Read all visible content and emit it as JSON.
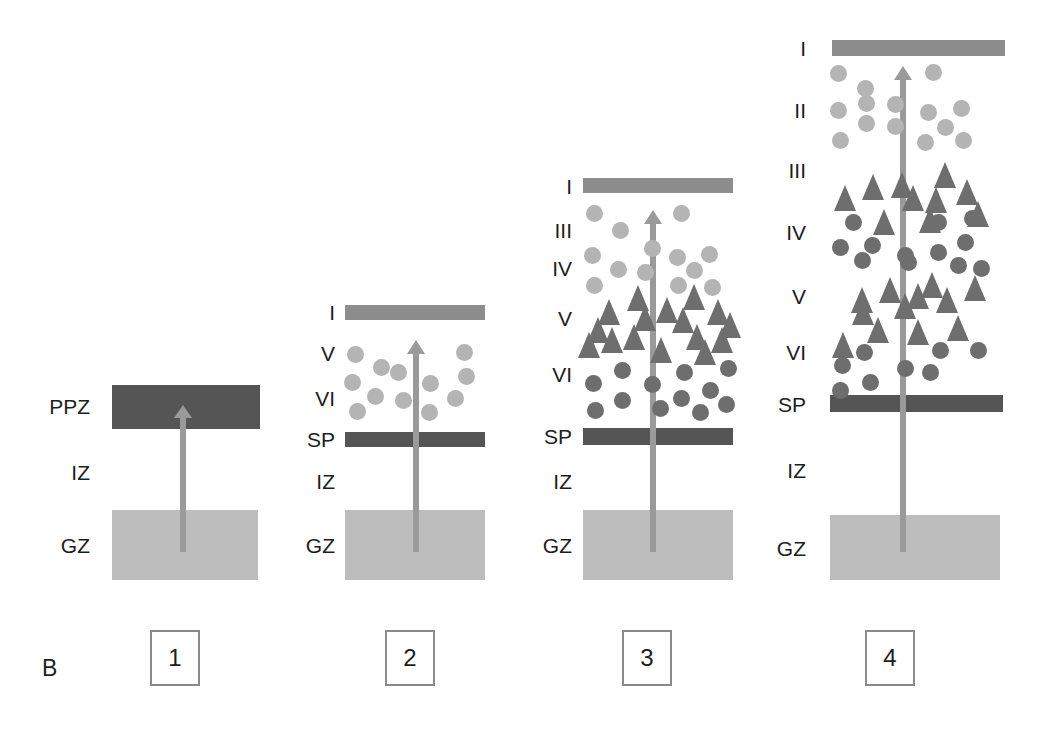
{
  "figure": {
    "panel_letter": "B",
    "colors": {
      "germinal_zone": "#bdbdbd",
      "layer_one_band": "#8d8d8d",
      "subplate_band": "#555555",
      "preplate_band": "#555555",
      "arrow": "#9a9a9a",
      "light_circle": "#b4b4b4",
      "dark_circle": "#6e6e6e",
      "triangle": "#6e6e6e",
      "box_border": "#8a8a8a",
      "text": "#1d1d1d",
      "background": "#ffffff"
    }
  },
  "panels": [
    {
      "number": "1",
      "labels": [
        "PPZ",
        "IZ",
        "GZ"
      ],
      "bands": [
        {
          "name": "preplate-zone",
          "label": "PPZ"
        },
        {
          "name": "intermediate-zone",
          "label": "IZ"
        },
        {
          "name": "germinal-zone",
          "label": "GZ"
        }
      ],
      "cells": {
        "light_circles": 0,
        "dark_circles": 0,
        "triangles": 0
      },
      "migration_arrow": true
    },
    {
      "number": "2",
      "labels": [
        "I",
        "V",
        "VI",
        "SP",
        "IZ",
        "GZ"
      ],
      "bands": [
        {
          "name": "layer-one",
          "label": "I"
        },
        {
          "name": "layer-five",
          "label": "V"
        },
        {
          "name": "layer-six",
          "label": "VI"
        },
        {
          "name": "subplate",
          "label": "SP"
        },
        {
          "name": "intermediate-zone",
          "label": "IZ"
        },
        {
          "name": "germinal-zone",
          "label": "GZ"
        }
      ],
      "cells": {
        "light_circles": 12,
        "dark_circles": 0,
        "triangles": 0
      },
      "migration_arrow": true
    },
    {
      "number": "3",
      "labels": [
        "I",
        "III",
        "IV",
        "V",
        "VI",
        "SP",
        "IZ",
        "GZ"
      ],
      "bands": [
        {
          "name": "layer-one",
          "label": "I"
        },
        {
          "name": "layer-three",
          "label": "III"
        },
        {
          "name": "layer-four",
          "label": "IV"
        },
        {
          "name": "layer-five",
          "label": "V"
        },
        {
          "name": "layer-six",
          "label": "VI"
        },
        {
          "name": "subplate",
          "label": "SP"
        },
        {
          "name": "intermediate-zone",
          "label": "IZ"
        },
        {
          "name": "germinal-zone",
          "label": "GZ"
        }
      ],
      "cells": {
        "light_circles": 13,
        "dark_circles": 12,
        "triangles": 16
      },
      "migration_arrow": true
    },
    {
      "number": "4",
      "labels": [
        "I",
        "II",
        "III",
        "IV",
        "V",
        "VI",
        "SP",
        "IZ",
        "GZ"
      ],
      "bands": [
        {
          "name": "layer-one",
          "label": "I"
        },
        {
          "name": "layer-two",
          "label": "II"
        },
        {
          "name": "layer-three",
          "label": "III"
        },
        {
          "name": "layer-four",
          "label": "IV"
        },
        {
          "name": "layer-five",
          "label": "V"
        },
        {
          "name": "layer-six",
          "label": "VI"
        },
        {
          "name": "subplate",
          "label": "SP"
        },
        {
          "name": "intermediate-zone",
          "label": "IZ"
        },
        {
          "name": "germinal-zone",
          "label": "GZ"
        }
      ],
      "cells": {
        "light_circles": 14,
        "dark_circles": 20,
        "triangles": 22
      },
      "migration_arrow": true
    }
  ],
  "panel1": {
    "labels": [
      {
        "text": "PPZ",
        "x": 100,
        "y": 406
      },
      {
        "text": "IZ",
        "x": 100,
        "y": 472
      },
      {
        "text": "GZ",
        "x": 100,
        "y": 545
      }
    ],
    "ppz_band": {
      "x": 112,
      "y": 385,
      "w": 148,
      "h": 44
    },
    "gz_band": {
      "x": 112,
      "y": 510,
      "w": 146,
      "h": 70
    },
    "arrow": {
      "x": 183,
      "y_top": 416,
      "y_bottom": 552
    }
  },
  "panel2": {
    "labels": [
      {
        "text": "I",
        "x": 335,
        "y": 312
      },
      {
        "text": "V",
        "x": 335,
        "y": 353
      },
      {
        "text": "VI",
        "x": 335,
        "y": 398
      },
      {
        "text": "SP",
        "x": 335,
        "y": 439
      },
      {
        "text": "IZ",
        "x": 335,
        "y": 481
      },
      {
        "text": "GZ",
        "x": 335,
        "y": 545
      }
    ],
    "layerI_band": {
      "x": 345,
      "y": 305,
      "w": 140,
      "h": 15
    },
    "sp_band": {
      "x": 345,
      "y": 432,
      "w": 140,
      "h": 15
    },
    "gz_band": {
      "x": 345,
      "y": 510,
      "w": 140,
      "h": 70
    },
    "arrow": {
      "x": 416,
      "y_top": 352,
      "y_bottom": 552
    },
    "light_circles": [
      {
        "x": 355,
        "y": 354
      },
      {
        "x": 381,
        "y": 367
      },
      {
        "x": 464,
        "y": 352
      },
      {
        "x": 352,
        "y": 382
      },
      {
        "x": 375,
        "y": 396
      },
      {
        "x": 403,
        "y": 400
      },
      {
        "x": 430,
        "y": 383
      },
      {
        "x": 466,
        "y": 376
      },
      {
        "x": 455,
        "y": 398
      },
      {
        "x": 357,
        "y": 411
      },
      {
        "x": 429,
        "y": 412
      },
      {
        "x": 398,
        "y": 372
      }
    ]
  },
  "panel3": {
    "labels": [
      {
        "text": "I",
        "x": 572,
        "y": 186
      },
      {
        "text": "III",
        "x": 572,
        "y": 230
      },
      {
        "text": "IV",
        "x": 572,
        "y": 268
      },
      {
        "text": "V",
        "x": 572,
        "y": 318
      },
      {
        "text": "VI",
        "x": 572,
        "y": 374
      },
      {
        "text": "SP",
        "x": 572,
        "y": 436
      },
      {
        "text": "IZ",
        "x": 572,
        "y": 481
      },
      {
        "text": "GZ",
        "x": 572,
        "y": 545
      }
    ],
    "layerI_band": {
      "x": 583,
      "y": 178,
      "w": 150,
      "h": 15
    },
    "sp_band": {
      "x": 583,
      "y": 428,
      "w": 150,
      "h": 17
    },
    "gz_band": {
      "x": 583,
      "y": 510,
      "w": 150,
      "h": 70
    },
    "arrow": {
      "x": 653,
      "y_top": 222,
      "y_bottom": 552
    },
    "light_circles": [
      {
        "x": 594,
        "y": 213
      },
      {
        "x": 620,
        "y": 230
      },
      {
        "x": 681,
        "y": 213
      },
      {
        "x": 592,
        "y": 255
      },
      {
        "x": 618,
        "y": 269
      },
      {
        "x": 645,
        "y": 272
      },
      {
        "x": 677,
        "y": 257
      },
      {
        "x": 709,
        "y": 254
      },
      {
        "x": 694,
        "y": 270
      },
      {
        "x": 594,
        "y": 285
      },
      {
        "x": 678,
        "y": 285
      },
      {
        "x": 652,
        "y": 248
      },
      {
        "x": 712,
        "y": 287
      }
    ],
    "triangles": [
      {
        "x": 609,
        "y": 312
      },
      {
        "x": 638,
        "y": 298
      },
      {
        "x": 667,
        "y": 310
      },
      {
        "x": 694,
        "y": 297
      },
      {
        "x": 718,
        "y": 312
      },
      {
        "x": 589,
        "y": 345
      },
      {
        "x": 634,
        "y": 337
      },
      {
        "x": 661,
        "y": 350
      },
      {
        "x": 697,
        "y": 337
      },
      {
        "x": 722,
        "y": 340
      },
      {
        "x": 612,
        "y": 340
      },
      {
        "x": 683,
        "y": 320
      },
      {
        "x": 645,
        "y": 318
      },
      {
        "x": 705,
        "y": 352
      },
      {
        "x": 598,
        "y": 330
      },
      {
        "x": 730,
        "y": 325
      }
    ],
    "dark_circles": [
      {
        "x": 622,
        "y": 370
      },
      {
        "x": 593,
        "y": 383
      },
      {
        "x": 652,
        "y": 384
      },
      {
        "x": 622,
        "y": 400
      },
      {
        "x": 681,
        "y": 398
      },
      {
        "x": 710,
        "y": 390
      },
      {
        "x": 595,
        "y": 410
      },
      {
        "x": 728,
        "y": 368
      },
      {
        "x": 700,
        "y": 412
      },
      {
        "x": 660,
        "y": 408
      },
      {
        "x": 726,
        "y": 404
      },
      {
        "x": 684,
        "y": 372
      }
    ]
  },
  "panel4": {
    "labels": [
      {
        "text": "I",
        "x": 806,
        "y": 48
      },
      {
        "text": "II",
        "x": 806,
        "y": 110
      },
      {
        "text": "III",
        "x": 806,
        "y": 170
      },
      {
        "text": "IV",
        "x": 806,
        "y": 232
      },
      {
        "text": "V",
        "x": 806,
        "y": 296
      },
      {
        "text": "VI",
        "x": 806,
        "y": 352
      },
      {
        "text": "SP",
        "x": 806,
        "y": 404
      },
      {
        "text": "IZ",
        "x": 806,
        "y": 470
      },
      {
        "text": "GZ",
        "x": 806,
        "y": 548
      }
    ],
    "layerI_band": {
      "x": 832,
      "y": 40,
      "w": 173,
      "h": 16
    },
    "sp_band": {
      "x": 830,
      "y": 395,
      "w": 173,
      "h": 17
    },
    "gz_band": {
      "x": 830,
      "y": 515,
      "w": 170,
      "h": 65
    },
    "arrow": {
      "x": 903,
      "y_top": 78,
      "y_bottom": 552
    },
    "light_circles": [
      {
        "x": 838,
        "y": 73
      },
      {
        "x": 865,
        "y": 88
      },
      {
        "x": 866,
        "y": 103
      },
      {
        "x": 933,
        "y": 72
      },
      {
        "x": 838,
        "y": 110
      },
      {
        "x": 866,
        "y": 123
      },
      {
        "x": 895,
        "y": 126
      },
      {
        "x": 928,
        "y": 112
      },
      {
        "x": 961,
        "y": 108
      },
      {
        "x": 945,
        "y": 127
      },
      {
        "x": 840,
        "y": 140
      },
      {
        "x": 925,
        "y": 142
      },
      {
        "x": 895,
        "y": 104
      },
      {
        "x": 963,
        "y": 140
      }
    ],
    "triangles": [
      {
        "x": 945,
        "y": 175
      },
      {
        "x": 873,
        "y": 187
      },
      {
        "x": 902,
        "y": 185
      },
      {
        "x": 845,
        "y": 198
      },
      {
        "x": 936,
        "y": 200
      },
      {
        "x": 967,
        "y": 192
      },
      {
        "x": 913,
        "y": 198
      },
      {
        "x": 978,
        "y": 214
      },
      {
        "x": 884,
        "y": 222
      },
      {
        "x": 930,
        "y": 220
      },
      {
        "x": 890,
        "y": 290
      },
      {
        "x": 862,
        "y": 300
      },
      {
        "x": 918,
        "y": 296
      },
      {
        "x": 947,
        "y": 300
      },
      {
        "x": 975,
        "y": 288
      },
      {
        "x": 878,
        "y": 330
      },
      {
        "x": 918,
        "y": 332
      },
      {
        "x": 958,
        "y": 328
      },
      {
        "x": 843,
        "y": 345
      },
      {
        "x": 905,
        "y": 306
      },
      {
        "x": 932,
        "y": 285
      },
      {
        "x": 863,
        "y": 312
      }
    ],
    "dark_circles": [
      {
        "x": 853,
        "y": 222
      },
      {
        "x": 938,
        "y": 222
      },
      {
        "x": 972,
        "y": 218
      },
      {
        "x": 840,
        "y": 247
      },
      {
        "x": 872,
        "y": 245
      },
      {
        "x": 905,
        "y": 255
      },
      {
        "x": 862,
        "y": 260
      },
      {
        "x": 938,
        "y": 252
      },
      {
        "x": 965,
        "y": 242
      },
      {
        "x": 981,
        "y": 268
      },
      {
        "x": 908,
        "y": 262
      },
      {
        "x": 958,
        "y": 265
      },
      {
        "x": 864,
        "y": 352
      },
      {
        "x": 940,
        "y": 350
      },
      {
        "x": 978,
        "y": 350
      },
      {
        "x": 842,
        "y": 365
      },
      {
        "x": 905,
        "y": 368
      },
      {
        "x": 930,
        "y": 372
      },
      {
        "x": 870,
        "y": 382
      },
      {
        "x": 840,
        "y": 390
      }
    ]
  },
  "number_boxes": [
    {
      "label": "1",
      "x": 150,
      "y": 630
    },
    {
      "label": "2",
      "x": 385,
      "y": 630
    },
    {
      "label": "3",
      "x": 622,
      "y": 630
    },
    {
      "label": "4",
      "x": 865,
      "y": 630
    }
  ]
}
